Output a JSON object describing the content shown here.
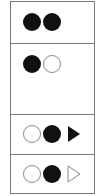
{
  "diagram": {
    "panels": [
      {
        "id": "panel-1",
        "symbols": [
          "filled-circle",
          "filled-circle"
        ]
      },
      {
        "id": "panel-2",
        "symbols": [
          "filled-circle",
          "hollow-circle"
        ]
      },
      {
        "id": "panel-3",
        "symbols": [
          "hollow-circle",
          "filled-circle",
          "filled-triangle-right"
        ]
      },
      {
        "id": "panel-4",
        "symbols": [
          "hollow-circle",
          "filled-circle",
          "hollow-triangle-right"
        ]
      }
    ],
    "colors": {
      "filled": "#111111",
      "outline": "#8a8a8a",
      "border": "#7a7a7a",
      "background": "#ffffff"
    }
  }
}
